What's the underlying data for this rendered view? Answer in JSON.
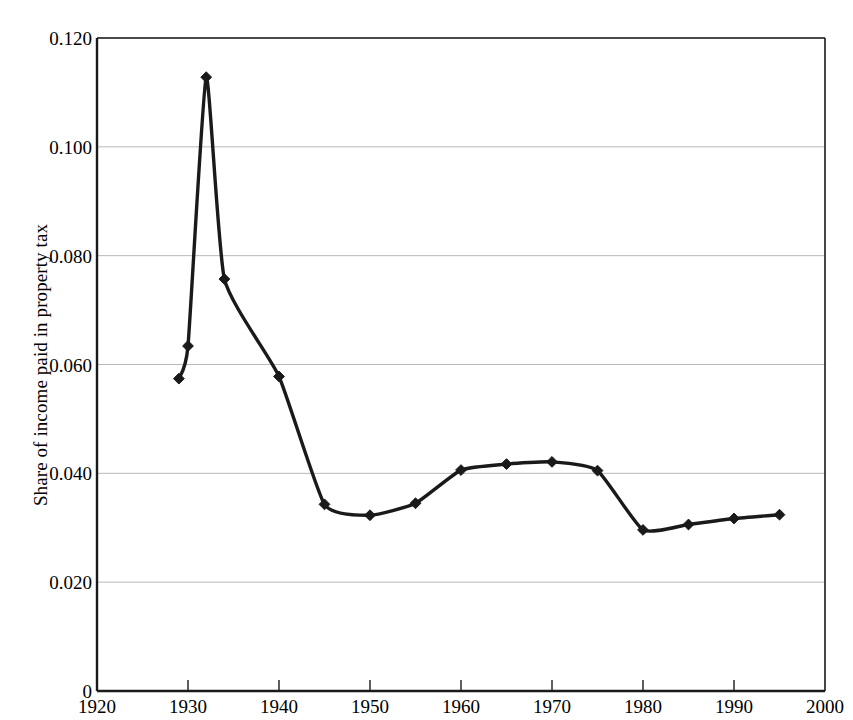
{
  "chart_data": {
    "type": "line",
    "title": "",
    "xlabel": "",
    "ylabel": "Share of income paid in property tax",
    "xlim": [
      1920,
      2000
    ],
    "ylim": [
      0,
      0.12
    ],
    "grid": true,
    "legend": "none",
    "marker": "diamond",
    "x_ticks": [
      "1920",
      "1930",
      "1940",
      "1950",
      "1960",
      "1970",
      "1980",
      "1990",
      "2000"
    ],
    "x_tick_values": [
      1920,
      1930,
      1940,
      1950,
      1960,
      1970,
      1980,
      1990,
      2000
    ],
    "y_ticks": [
      "0",
      "0.020",
      "0.040",
      "0.060",
      "0.080",
      "0.100",
      "0.120"
    ],
    "y_tick_values": [
      0,
      0.02,
      0.04,
      0.06,
      0.08,
      0.1,
      0.12
    ],
    "series": [
      {
        "name": "Share of income paid in property tax",
        "color": "#1a1a1a",
        "x": [
          1929,
          1930,
          1932,
          1934,
          1940,
          1945,
          1950,
          1955,
          1960,
          1965,
          1970,
          1975,
          1980,
          1985,
          1990,
          1995
        ],
        "values": [
          0.0574,
          0.0634,
          0.1128,
          0.0757,
          0.0578,
          0.0343,
          0.0323,
          0.0345,
          0.0406,
          0.0417,
          0.0421,
          0.0405,
          0.0296,
          0.0306,
          0.0317,
          0.0324
        ]
      }
    ]
  },
  "axes": {
    "y_axis_label": "Share of income paid in property tax"
  }
}
